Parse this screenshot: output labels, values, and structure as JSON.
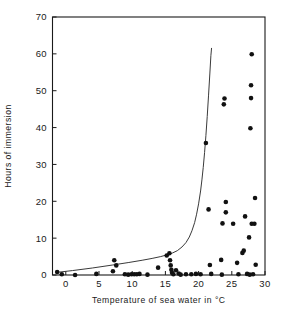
{
  "figure": {
    "background_color": "#ffffff",
    "foreground_color": "#1a1a1a",
    "point_color": "#111111",
    "curve_color": "#3a3a3a"
  },
  "axes": {
    "x_title": "Temperature of sea water in °C",
    "y_title": "Hours of immersion",
    "x_ticks": [
      "0",
      "5",
      "10",
      "15",
      "20",
      "25",
      "30"
    ],
    "x_tick_values": [
      0,
      5,
      10,
      15,
      20,
      25,
      30
    ],
    "y_ticks": [
      "0",
      "10",
      "20",
      "30",
      "40",
      "50",
      "60",
      "70"
    ],
    "y_tick_values": [
      0,
      10,
      20,
      30,
      40,
      50,
      60,
      70
    ],
    "xlim": [
      -2,
      30
    ],
    "ylim": [
      0,
      70
    ],
    "grid": false,
    "frame": "box"
  },
  "chart_data": {
    "type": "scatter",
    "title": "",
    "subtitle": "",
    "xlabel": "Temperature of sea water in °C",
    "ylabel": "Hours of immersion",
    "xlim": [
      -2,
      30
    ],
    "ylim": [
      0,
      70
    ],
    "grid": false,
    "legend": null,
    "legend_position": "none",
    "annotations": [],
    "series": [
      {
        "name": "Observations",
        "type": "scatter",
        "marker": "filled-circle",
        "marker_size_px": 4.6,
        "color": "#111111",
        "points": [
          [
            -1.3,
            0.8
          ],
          [
            -0.6,
            0.2
          ],
          [
            1.4,
            0.0
          ],
          [
            4.6,
            0.3
          ],
          [
            7.1,
            1.0
          ],
          [
            7.3,
            4.0
          ],
          [
            7.6,
            2.6
          ],
          [
            8.9,
            0.2
          ],
          [
            9.4,
            0.1
          ],
          [
            9.9,
            0.2
          ],
          [
            10.3,
            0.2
          ],
          [
            10.7,
            0.2
          ],
          [
            11.1,
            0.3
          ],
          [
            12.3,
            0.1
          ],
          [
            13.9,
            2.0
          ],
          [
            15.2,
            5.3
          ],
          [
            15.6,
            5.9
          ],
          [
            15.7,
            4.0
          ],
          [
            15.8,
            2.6
          ],
          [
            15.9,
            1.4
          ],
          [
            16.0,
            0.6
          ],
          [
            16.2,
            0.2
          ],
          [
            16.6,
            1.3
          ],
          [
            17.0,
            0.4
          ],
          [
            17.3,
            0.1
          ],
          [
            18.1,
            0.2
          ],
          [
            18.9,
            0.2
          ],
          [
            19.6,
            0.3
          ],
          [
            20.3,
            0.2
          ],
          [
            21.1,
            35.8
          ],
          [
            21.5,
            17.8
          ],
          [
            21.7,
            2.7
          ],
          [
            21.9,
            0.3
          ],
          [
            23.4,
            4.1
          ],
          [
            23.5,
            0.1
          ],
          [
            23.6,
            14.0
          ],
          [
            23.8,
            46.3
          ],
          [
            23.9,
            47.9
          ],
          [
            24.1,
            19.8
          ],
          [
            24.1,
            17.0
          ],
          [
            25.2,
            13.9
          ],
          [
            25.8,
            3.3
          ],
          [
            26.0,
            0.2
          ],
          [
            26.6,
            6.0
          ],
          [
            26.8,
            6.6
          ],
          [
            27.0,
            15.9
          ],
          [
            27.3,
            0.3
          ],
          [
            27.6,
            10.2
          ],
          [
            27.7,
            0.1
          ],
          [
            27.8,
            39.8
          ],
          [
            27.9,
            48.0
          ],
          [
            27.9,
            51.5
          ],
          [
            28.0,
            59.9
          ],
          [
            28.0,
            13.9
          ],
          [
            28.2,
            0.2
          ],
          [
            28.4,
            13.9
          ],
          [
            28.5,
            20.9
          ],
          [
            28.6,
            2.8
          ]
        ]
      },
      {
        "name": "Fitted curve",
        "type": "line",
        "color": "#3a3a3a",
        "line_width_px": 1,
        "points": [
          [
            -1.4,
            0.7
          ],
          [
            1.0,
            1.2
          ],
          [
            4.0,
            1.9
          ],
          [
            7.0,
            2.7
          ],
          [
            9.5,
            3.4
          ],
          [
            11.5,
            4.0
          ],
          [
            13.0,
            4.5
          ],
          [
            14.3,
            5.0
          ],
          [
            15.3,
            5.5
          ],
          [
            16.1,
            6.0
          ],
          [
            16.8,
            6.6
          ],
          [
            17.5,
            7.6
          ],
          [
            18.1,
            8.8
          ],
          [
            18.6,
            10.3
          ],
          [
            19.0,
            12.0
          ],
          [
            19.4,
            14.2
          ],
          [
            19.7,
            16.5
          ],
          [
            20.0,
            19.3
          ],
          [
            20.3,
            22.8
          ],
          [
            20.5,
            25.8
          ],
          [
            20.7,
            29.2
          ],
          [
            20.9,
            33.2
          ],
          [
            21.1,
            37.8
          ],
          [
            21.3,
            43.0
          ],
          [
            21.5,
            48.8
          ],
          [
            21.7,
            54.8
          ],
          [
            21.85,
            59.5
          ],
          [
            21.95,
            61.5
          ]
        ]
      }
    ]
  }
}
